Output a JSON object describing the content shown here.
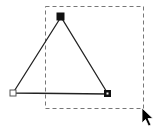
{
  "canvas": {
    "width": 163,
    "height": 136,
    "background": "#ffffff"
  },
  "selection_rectangle": {
    "x": 45,
    "y": 6,
    "width": 98,
    "height": 102,
    "stroke": "#777777",
    "style": "dashed"
  },
  "triangle": {
    "stroke": "#222222",
    "vertices": [
      {
        "name": "apex",
        "x": 61,
        "y": 16,
        "handle": "filled"
      },
      {
        "name": "left",
        "x": 13,
        "y": 93,
        "handle": "hollow"
      },
      {
        "name": "right",
        "x": 108,
        "y": 94,
        "handle": "filled"
      }
    ]
  },
  "cursor": {
    "icon": "arrow-pointer-icon",
    "x": 143,
    "y": 109
  }
}
